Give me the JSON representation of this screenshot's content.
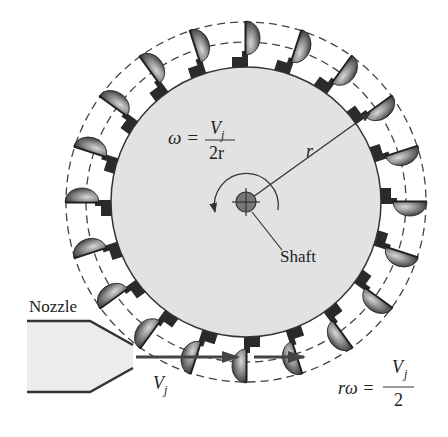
{
  "diagram": {
    "labels": {
      "nozzle": "Nozzle",
      "shaft": "Shaft",
      "radius": "r",
      "omega_lhs": "ω =",
      "omega_num": "V",
      "omega_num_sub": "j",
      "omega_den": "2r",
      "jet_velocity": "V",
      "jet_velocity_sub": "j",
      "rw_lhs": "rω =",
      "rw_num": "V",
      "rw_num_sub": "j",
      "rw_den": "2"
    },
    "components": {
      "wheel": {
        "center": [
          246,
          202
        ],
        "disk_radius": 135,
        "bucket_count": 20
      },
      "dashed_circles": [
        {
          "radius": 168
        },
        {
          "radius": 180
        }
      ],
      "nozzle": {
        "position": "bottom-left",
        "jet_direction": "right"
      },
      "rotation_arrow": "counter-clockwise"
    },
    "colors": {
      "disk": "#e2e2e2",
      "bucket_dark": "#2a2a2a",
      "bucket_light": "#9a9a9a",
      "stroke": "#333333",
      "nozzle_fill": "#ececec"
    }
  }
}
